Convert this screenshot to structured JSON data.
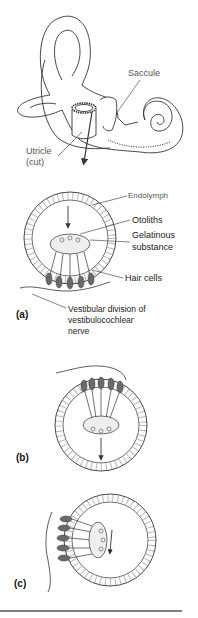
{
  "figure": {
    "top_labels": {
      "saccule": "Saccule",
      "utricle_line1": "Utricle",
      "utricle_line2": "(cut)"
    },
    "panel_a": {
      "tag": "(a)",
      "endolymph": "Endolymph",
      "otoliths": "Otoliths",
      "gelatinous_line1": "Gelatinous",
      "gelatinous_line2": "substance",
      "hair_cells": "Hair cells",
      "nerve_line1": "Vestibular division of",
      "nerve_line2": "vestibulocochlear",
      "nerve_line3": "nerve"
    },
    "panel_b": {
      "tag": "(b)"
    },
    "panel_c": {
      "tag": "(c)"
    },
    "colors": {
      "outline": "#333333",
      "hair_cell_fill": "#6a6a6a",
      "gel_fill": "#eeeeee",
      "rule": "#555555"
    }
  }
}
